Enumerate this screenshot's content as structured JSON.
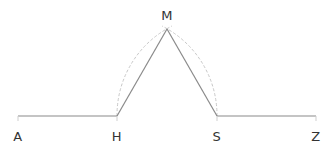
{
  "diagram": {
    "points": [
      {
        "id": "A",
        "label": "A",
        "x": 18,
        "y": 116
      },
      {
        "id": "H",
        "label": "H",
        "x": 117,
        "y": 116
      },
      {
        "id": "S",
        "label": "S",
        "x": 217,
        "y": 116
      },
      {
        "id": "Z",
        "label": "Z",
        "x": 316,
        "y": 116
      },
      {
        "id": "M",
        "label": "M",
        "x": 167,
        "y": 29
      }
    ],
    "segments": [
      {
        "from": "A",
        "to": "H",
        "style": "solid"
      },
      {
        "from": "H",
        "to": "M",
        "style": "solid"
      },
      {
        "from": "M",
        "to": "S",
        "style": "solid"
      },
      {
        "from": "S",
        "to": "Z",
        "style": "solid"
      }
    ],
    "arcs": [
      {
        "center": "S",
        "radius": 100,
        "from": "H",
        "to": "M",
        "style": "dashed"
      },
      {
        "center": "H",
        "radius": 100,
        "from": "S",
        "to": "M",
        "style": "dashed"
      }
    ],
    "colors": {
      "line": "#8a8a8a",
      "arc": "#c4c4c4",
      "label": "#333333"
    }
  }
}
